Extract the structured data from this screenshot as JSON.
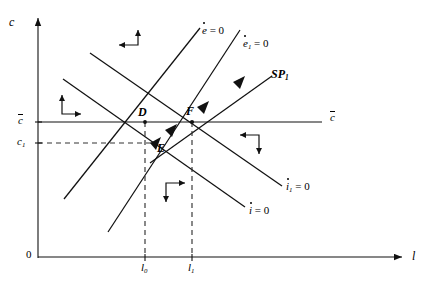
{
  "figure": {
    "type": "phase-diagram",
    "width": 443,
    "height": 284,
    "background": "#ffffff",
    "line_color": "#1a1a1a"
  },
  "axes": {
    "x_label": "l",
    "y_label": "c",
    "origin_label": "0",
    "x_axis": {
      "x_start": 38,
      "x_end": 400,
      "y": 257
    },
    "y_axis": {
      "x": 38,
      "y_start": 258,
      "y_end": 16
    }
  },
  "axis_ticks": {
    "x": [
      {
        "label": "l",
        "sub": "0",
        "x": 145
      },
      {
        "label": "l",
        "sub": "1",
        "x": 192
      }
    ],
    "y": [
      {
        "label": "c",
        "bar": true,
        "sub": "",
        "y": 122
      },
      {
        "label": "c",
        "bar": false,
        "sub": "1",
        "y": 143
      }
    ]
  },
  "points": [
    {
      "name": "D",
      "label": "D",
      "x": 145,
      "y": 122
    },
    {
      "name": "F",
      "label": "F",
      "x": 192,
      "y": 122
    },
    {
      "name": "E",
      "label": "E",
      "x": 156,
      "y": 143
    }
  ],
  "curve_labels": [
    {
      "id": "e-dot-zero",
      "base": "e",
      "dot": true,
      "sub": "",
      "eq": " = 0",
      "x": 202,
      "y": 29
    },
    {
      "id": "e1-dot-zero",
      "base": "e",
      "dot": true,
      "sub": "1",
      "eq": " = 0",
      "x": 243,
      "y": 42
    },
    {
      "id": "sp1",
      "base": "SP",
      "dot": false,
      "sub": "1",
      "eq": "",
      "x": 271,
      "y": 72
    },
    {
      "id": "i1-dot-zero",
      "base": "i",
      "dot": true,
      "sub": "1",
      "eq": " = 0",
      "x": 286,
      "y": 185
    },
    {
      "id": "i-dot-zero",
      "base": "i",
      "dot": true,
      "sub": "",
      "eq": " = 0",
      "x": 249,
      "y": 209
    },
    {
      "id": "c-bar-right",
      "base": "c",
      "dot": false,
      "bar": true,
      "sub": "",
      "eq": "",
      "x": 330,
      "y": 115
    }
  ],
  "direction_indicators": [
    {
      "id": "quadrant-upper-left",
      "arrows": "left-up",
      "x": 112,
      "y": 31
    },
    {
      "id": "quadrant-left",
      "arrows": "up-right",
      "x": 55,
      "y": 96
    },
    {
      "id": "quadrant-lower-middle",
      "arrows": "down-right",
      "x": 163,
      "y": 182
    },
    {
      "id": "quadrant-right",
      "arrows": "left-down",
      "x": 233,
      "y": 131
    }
  ],
  "lines": {
    "downward_upper": {
      "count": 2,
      "note": "two parallel downward-sloping i-dot loci"
    },
    "upward": {
      "count": 2,
      "note": "two upward-sloping e-dot loci"
    },
    "saddle_path": {
      "count": 1,
      "note": "SP1 with arrowheads toward F"
    },
    "c_bar_horizontal": {
      "note": "horizontal c-bar line across plot"
    },
    "dashed_verticals": {
      "count": 2,
      "note": "at l0 and l1"
    },
    "dashed_horizontal": {
      "count": 1,
      "note": "at c1 to point E"
    }
  }
}
